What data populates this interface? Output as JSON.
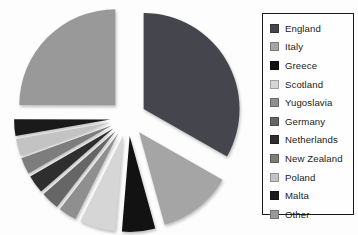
{
  "chart_data": {
    "type": "pie",
    "title": "",
    "labels": [
      "England",
      "Italy",
      "Greece",
      "Scotland",
      "Yugoslavia",
      "Germany",
      "Netherlands",
      "New Zealand",
      "Poland",
      "Malta",
      "Other"
    ],
    "values": [
      33.3,
      12.5,
      5.6,
      6.1,
      3.1,
      3.1,
      3.1,
      2.8,
      2.8,
      2.8,
      25.0
    ],
    "colors": [
      "#45454d",
      "#a5a5a5",
      "#121212",
      "#d6d6d6",
      "#8f8f8f",
      "#666666",
      "#2e2e2e",
      "#7d7d7d",
      "#c3c3c3",
      "#1a1a1a",
      "#999999"
    ],
    "start_angle_deg": 0,
    "direction": "clockwise",
    "exploded": true,
    "legend_position": "right",
    "legend_border_color": "#1a1a1a",
    "background_color": "#fdfdfd"
  }
}
